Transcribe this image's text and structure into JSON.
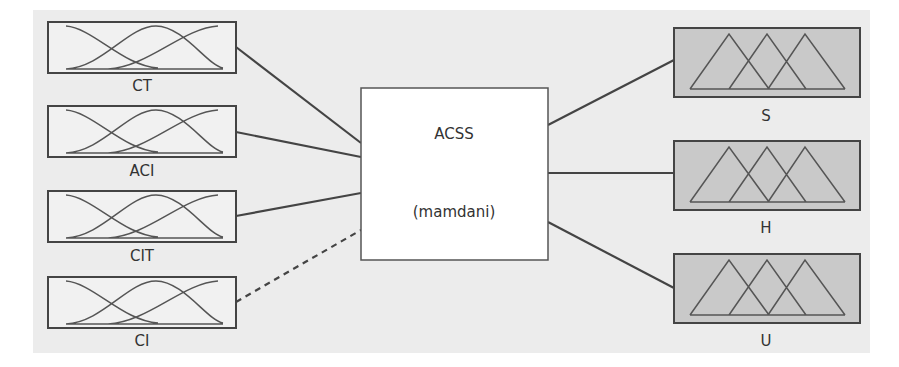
{
  "diagram": {
    "type": "fuzzy-inference-system",
    "colors": {
      "background": "#ececec",
      "input_box_fill": "#f1f1f1",
      "output_box_fill": "#c9c9c9",
      "center_box_fill": "#ffffff",
      "stroke": "#444444"
    },
    "center": {
      "title": "ACSS",
      "subtitle": "(mamdani)"
    },
    "inputs": [
      {
        "label": "CT",
        "connector": "solid"
      },
      {
        "label": "ACI",
        "connector": "solid"
      },
      {
        "label": "CIT",
        "connector": "solid"
      },
      {
        "label": "CI",
        "connector": "dashed"
      }
    ],
    "outputs": [
      {
        "label": "S",
        "connector": "solid"
      },
      {
        "label": "H",
        "connector": "solid"
      },
      {
        "label": "U",
        "connector": "solid"
      }
    ],
    "input_mf_shape": "gaussian",
    "output_mf_shape": "triangular"
  }
}
